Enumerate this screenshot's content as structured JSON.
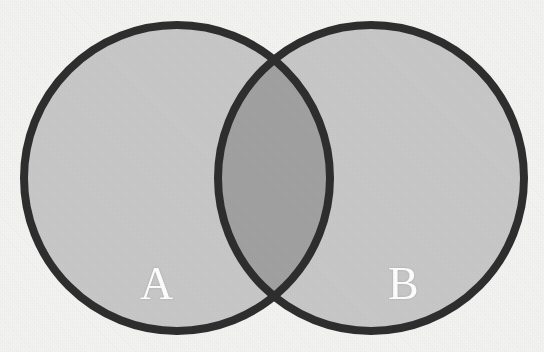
{
  "figure": {
    "kind": "venn-diagram",
    "width": 544,
    "height": 352,
    "background_color": "#f4f4f3"
  },
  "diagram": {
    "sets": [
      {
        "id": "A",
        "label": "A",
        "label_color": "#ffffff",
        "center_x": 177,
        "center_y": 178,
        "radius": 153,
        "fill_color": "#c9c9c9",
        "stroke_color": "#2e2e2e",
        "stroke_width": 8,
        "label_x": 158,
        "label_y": 285
      },
      {
        "id": "B",
        "label": "B",
        "label_color": "#ffffff",
        "center_x": 371,
        "center_y": 178,
        "radius": 153,
        "fill_color": "#c9c9c9",
        "stroke_color": "#2e2e2e",
        "stroke_width": 8,
        "label_x": 404,
        "label_y": 285
      }
    ],
    "intersection": {
      "id": "A-and-B",
      "label": "",
      "fill_color": "#a2a2a2",
      "left_edge_x": 213,
      "right_edge_x": 335,
      "top_crossing_y": 70,
      "bottom_crossing_y": 300
    }
  }
}
